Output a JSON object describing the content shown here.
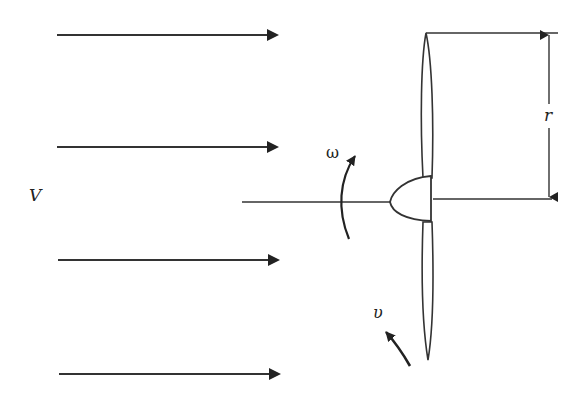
{
  "diagram": {
    "labels": {
      "wind_speed": "V",
      "angular_velocity": "ω",
      "blade_velocity": "υ",
      "radius": "r"
    },
    "wind_arrows": [
      {
        "y": 35,
        "x1": 57,
        "x2": 277
      },
      {
        "y": 147,
        "x1": 57,
        "x2": 277
      },
      {
        "y": 260,
        "x1": 58,
        "x2": 278
      },
      {
        "y": 374,
        "x1": 59,
        "x2": 279
      }
    ],
    "colors": {
      "stroke": "#222222",
      "background": "#ffffff"
    }
  }
}
